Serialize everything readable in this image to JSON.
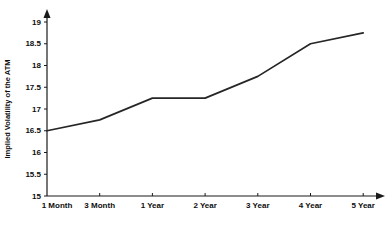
{
  "chart_data": {
    "type": "line",
    "title": "",
    "xlabel": "",
    "ylabel": "Implied Volatility of the ATM",
    "categories": [
      "1 Month",
      "3 Month",
      "1 Year",
      "2 Year",
      "3 Year",
      "4 Year",
      "5 Year"
    ],
    "values": [
      16.5,
      16.75,
      17.25,
      17.25,
      17.75,
      18.5,
      18.75
    ],
    "series": [
      {
        "name": "Implied Volatility of the ATM",
        "values": [
          16.5,
          16.75,
          17.25,
          17.25,
          17.75,
          18.5,
          18.75
        ]
      }
    ],
    "ylim": [
      15,
      19
    ],
    "ytick_labels": [
      "15",
      "15.5",
      "16",
      "16.5",
      "17",
      "17.5",
      "18",
      "18.5",
      "19"
    ],
    "ytick_values": [
      15,
      15.5,
      16,
      16.5,
      17,
      17.5,
      18,
      18.5,
      19
    ],
    "grid": false,
    "legend": false,
    "legend_position": "none",
    "line_color": "#262626",
    "axis_color": "#1a1a1a",
    "background_color": "#ffffff"
  }
}
